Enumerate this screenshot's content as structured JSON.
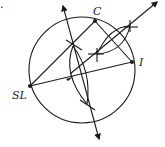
{
  "diagram": {
    "type": "geometric-construction",
    "labels": {
      "C": "C",
      "I": "I",
      "SL": "SL",
      "corner_mark": "."
    },
    "points": {
      "SL": {
        "x": 30,
        "y": 86
      },
      "C": {
        "x": 95,
        "y": 21
      },
      "I": {
        "x": 132,
        "y": 62
      }
    },
    "circle": {
      "cx": 82,
      "cy": 70,
      "r": 53
    },
    "colors": {
      "stroke": "#1a1a1a",
      "background": "#ffffff"
    }
  }
}
